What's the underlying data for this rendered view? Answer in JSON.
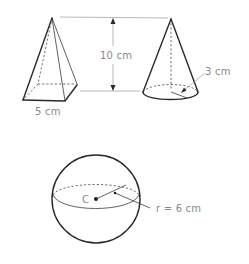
{
  "figure": {
    "pyramid": {
      "name": "square pyramid",
      "base_label": "5 cm"
    },
    "height_dimension": {
      "label": "10 cm"
    },
    "cone": {
      "name": "cone",
      "radius_label": "3 cm"
    },
    "sphere": {
      "name": "sphere",
      "center_label": "C",
      "radius_label": "r = 6 cm"
    }
  },
  "colors": {
    "outline": "#2a2a2a",
    "label": "#8a8a8a",
    "guide": "#9a9a9a"
  }
}
